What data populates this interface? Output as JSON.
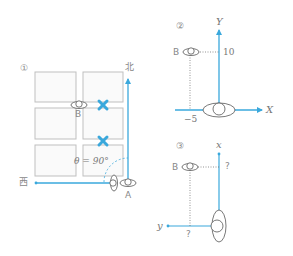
{
  "colors": {
    "accent_blue": "#3aa8dc",
    "grid_gray": "#bfbfbf",
    "text_gray": "#777777",
    "marker_blue": "#3aa8dc"
  },
  "panel1": {
    "number": "①",
    "north_label": "北",
    "west_label": "西",
    "point_a_label": "A",
    "point_b_label": "B",
    "angle_label": "θ = 90°",
    "obstacle_markers": [
      "x-mark",
      "x-mark"
    ]
  },
  "panel2": {
    "number": "②",
    "y_axis_label": "Y",
    "x_axis_label": "X",
    "point_b_label": "B",
    "y_value": "10",
    "x_value": "−5"
  },
  "panel3": {
    "number": "③",
    "x_axis_label": "x",
    "y_axis_label": "y",
    "point_b_label": "B",
    "x_unknown": "?",
    "y_unknown": "?"
  }
}
